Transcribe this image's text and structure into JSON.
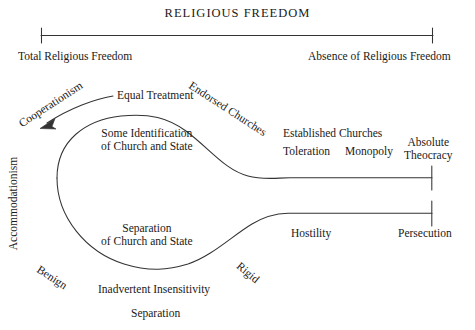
{
  "figure": {
    "title": "RELIGIOUS FREEDOM",
    "type": "continuum-diagram",
    "stroke_color": "#333333",
    "text_color": "#1a1a1a",
    "background": "#ffffff"
  },
  "scale": {
    "left_label": "Total Religious Freedom",
    "right_label": "Absence of Religious Freedom"
  },
  "axis_labels": {
    "cooperationism": "Cooperationism",
    "accommodationism": "Accommodationism",
    "endorsed_churches": "Endorsed Churches",
    "benign": "Benign",
    "rigid": "Rigid"
  },
  "upper_branch": {
    "equal_treatment": "Equal Treatment",
    "some_identification_line1": "Some Identification",
    "some_identification_line2": "of Church and State",
    "established_churches": "Established Churches",
    "toleration": "Toleration",
    "monopoly": "Monopoly",
    "absolute_line1": "Absolute",
    "absolute_line2": "Theocracy"
  },
  "lower_branch": {
    "separation_line1": "Separation",
    "separation_line2": "of Church and State",
    "inadvertent_insensitivity": "Inadvertent Insensitivity",
    "separation": "Separation",
    "hostility": "Hostility",
    "persecution": "Persecution"
  }
}
